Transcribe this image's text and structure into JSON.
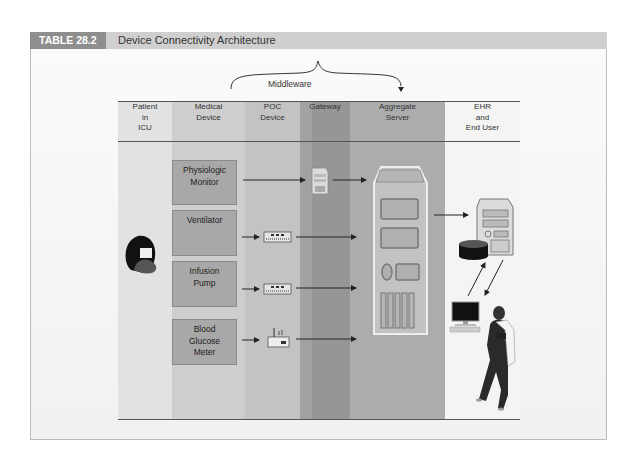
{
  "header": {
    "tag": "TABLE 28.2",
    "title": "Device Connectivity Architecture"
  },
  "middleware": {
    "label": "Middleware"
  },
  "columns": [
    {
      "label_lines": [
        "Patient",
        "in",
        "ICU"
      ],
      "shade": "#e4e4e4"
    },
    {
      "label_lines": [
        "Medical",
        "Device"
      ],
      "shade": "#cdcdcd"
    },
    {
      "label_lines": [
        "POC",
        "Device"
      ],
      "shade": "#c4c4c4"
    },
    {
      "label_lines": [
        "Gateway"
      ],
      "shade": "#9a9a9a"
    },
    {
      "label_lines": [
        "Aggregate",
        "Server"
      ],
      "shade": "#afafaf"
    },
    {
      "label_lines": [
        "EHR",
        "and",
        "End User"
      ],
      "shade": "#f3f3f3"
    }
  ],
  "devices": [
    {
      "label_lines": [
        "Physiologic",
        "Monitor"
      ],
      "poc_icon": "none"
    },
    {
      "label_lines": [
        "Ventilator"
      ],
      "poc_icon": "network-hub-icon"
    },
    {
      "label_lines": [
        "Infusion",
        "Pump"
      ],
      "poc_icon": "network-hub-icon"
    },
    {
      "label_lines": [
        "Blood",
        "Glucose",
        "Meter"
      ],
      "poc_icon": "wireless-router-icon"
    }
  ],
  "icons": {
    "patient": "patient-icon",
    "gateway": "gateway-server-icon",
    "aggregate": "aggregate-server-icon",
    "ehr_server": "ehr-server-icon",
    "database": "database-icon",
    "workstation": "computer-workstation-icon",
    "clinician": "clinician-icon"
  }
}
